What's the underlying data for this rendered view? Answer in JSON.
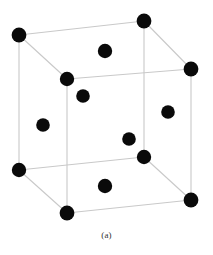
{
  "figure": {
    "caption": "(a)",
    "diagram_type": "face-centered-cubic-unit-cell",
    "background_color": "#ffffff",
    "atom_color": "#0a0a0a",
    "edge_color": "#c9c9c9",
    "edge_width": 1.1,
    "atom_radius": 7.2,
    "atom_radius_small": 6.6,
    "vertices": {
      "back_top_left": {
        "x": 19,
        "y": 35
      },
      "back_top_right": {
        "x": 144,
        "y": 21
      },
      "front_top_left": {
        "x": 67,
        "y": 79
      },
      "front_top_right": {
        "x": 191,
        "y": 69
      },
      "back_bottom_left": {
        "x": 19,
        "y": 170
      },
      "back_bottom_right": {
        "x": 144,
        "y": 157
      },
      "front_bottom_left": {
        "x": 67,
        "y": 213
      },
      "front_bottom_right": {
        "x": 191,
        "y": 200
      }
    },
    "corner_atoms": [
      {
        "name": "corner-back-top-left",
        "x": 19,
        "y": 35,
        "r": 7.4
      },
      {
        "name": "corner-back-top-right",
        "x": 144,
        "y": 21,
        "r": 7.4
      },
      {
        "name": "corner-front-top-left",
        "x": 67,
        "y": 79,
        "r": 7.2
      },
      {
        "name": "corner-front-top-right",
        "x": 191,
        "y": 69,
        "r": 7.4
      },
      {
        "name": "corner-back-bottom-left",
        "x": 19,
        "y": 170,
        "r": 7.2
      },
      {
        "name": "corner-back-bottom-right",
        "x": 144,
        "y": 157,
        "r": 7.2
      },
      {
        "name": "corner-front-bottom-left",
        "x": 67,
        "y": 213,
        "r": 7.4
      },
      {
        "name": "corner-front-bottom-right",
        "x": 191,
        "y": 200,
        "r": 7.4
      }
    ],
    "face_center_atoms": [
      {
        "name": "face-center-top",
        "x": 105,
        "y": 51,
        "r": 7.2
      },
      {
        "name": "face-center-front",
        "x": 83,
        "y": 96,
        "r": 6.8
      },
      {
        "name": "face-center-left",
        "x": 43,
        "y": 125,
        "r": 6.8
      },
      {
        "name": "face-center-right",
        "x": 168,
        "y": 112,
        "r": 6.8
      },
      {
        "name": "face-center-back",
        "x": 129,
        "y": 139,
        "r": 6.8
      },
      {
        "name": "face-center-bottom",
        "x": 105,
        "y": 186,
        "r": 7.2
      }
    ],
    "edges": [
      {
        "name": "edge-top-back",
        "x1": 19,
        "y1": 35,
        "x2": 144,
        "y2": 21
      },
      {
        "name": "edge-top-right-back",
        "x1": 144,
        "y1": 21,
        "x2": 191,
        "y2": 69
      },
      {
        "name": "edge-top-front-right",
        "x1": 191,
        "y1": 69,
        "x2": 67,
        "y2": 79
      },
      {
        "name": "edge-top-front-left",
        "x1": 67,
        "y1": 79,
        "x2": 19,
        "y2": 35
      },
      {
        "name": "edge-vertical-back-left",
        "x1": 19,
        "y1": 35,
        "x2": 19,
        "y2": 170
      },
      {
        "name": "edge-vertical-back-right",
        "x1": 144,
        "y1": 21,
        "x2": 144,
        "y2": 157
      },
      {
        "name": "edge-vertical-front-left",
        "x1": 67,
        "y1": 79,
        "x2": 67,
        "y2": 213
      },
      {
        "name": "edge-vertical-front-right",
        "x1": 191,
        "y1": 69,
        "x2": 191,
        "y2": 200
      },
      {
        "name": "edge-bottom-back",
        "x1": 19,
        "y1": 170,
        "x2": 144,
        "y2": 157
      },
      {
        "name": "edge-bottom-right-back",
        "x1": 144,
        "y1": 157,
        "x2": 191,
        "y2": 200
      },
      {
        "name": "edge-bottom-front-right",
        "x1": 191,
        "y1": 200,
        "x2": 67,
        "y2": 213
      },
      {
        "name": "edge-bottom-front-left",
        "x1": 67,
        "y1": 213,
        "x2": 19,
        "y2": 170
      }
    ]
  }
}
